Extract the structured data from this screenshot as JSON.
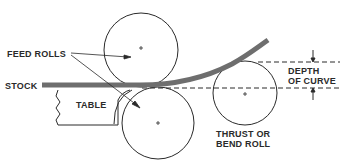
{
  "diagram": {
    "labels": {
      "feed_rolls": "FEED ROLLS",
      "stock": "STOCK",
      "table": "TABLE",
      "depth_line1": "DEPTH",
      "depth_line2": "OF CURVE",
      "thrust_line1": "THRUST OR",
      "thrust_line2": "BEND ROLL"
    },
    "colors": {
      "stroke": "#2a2a2a",
      "stock": "#6e6e6e",
      "background": "#ffffff"
    },
    "rolls": [
      {
        "name": "upper-feed-roll",
        "cx": 141,
        "cy": 50,
        "r": 37
      },
      {
        "name": "lower-feed-roll",
        "cx": 158,
        "cy": 123,
        "r": 36
      },
      {
        "name": "thrust-bend-roll",
        "cx": 245,
        "cy": 93,
        "r": 32
      }
    ]
  }
}
